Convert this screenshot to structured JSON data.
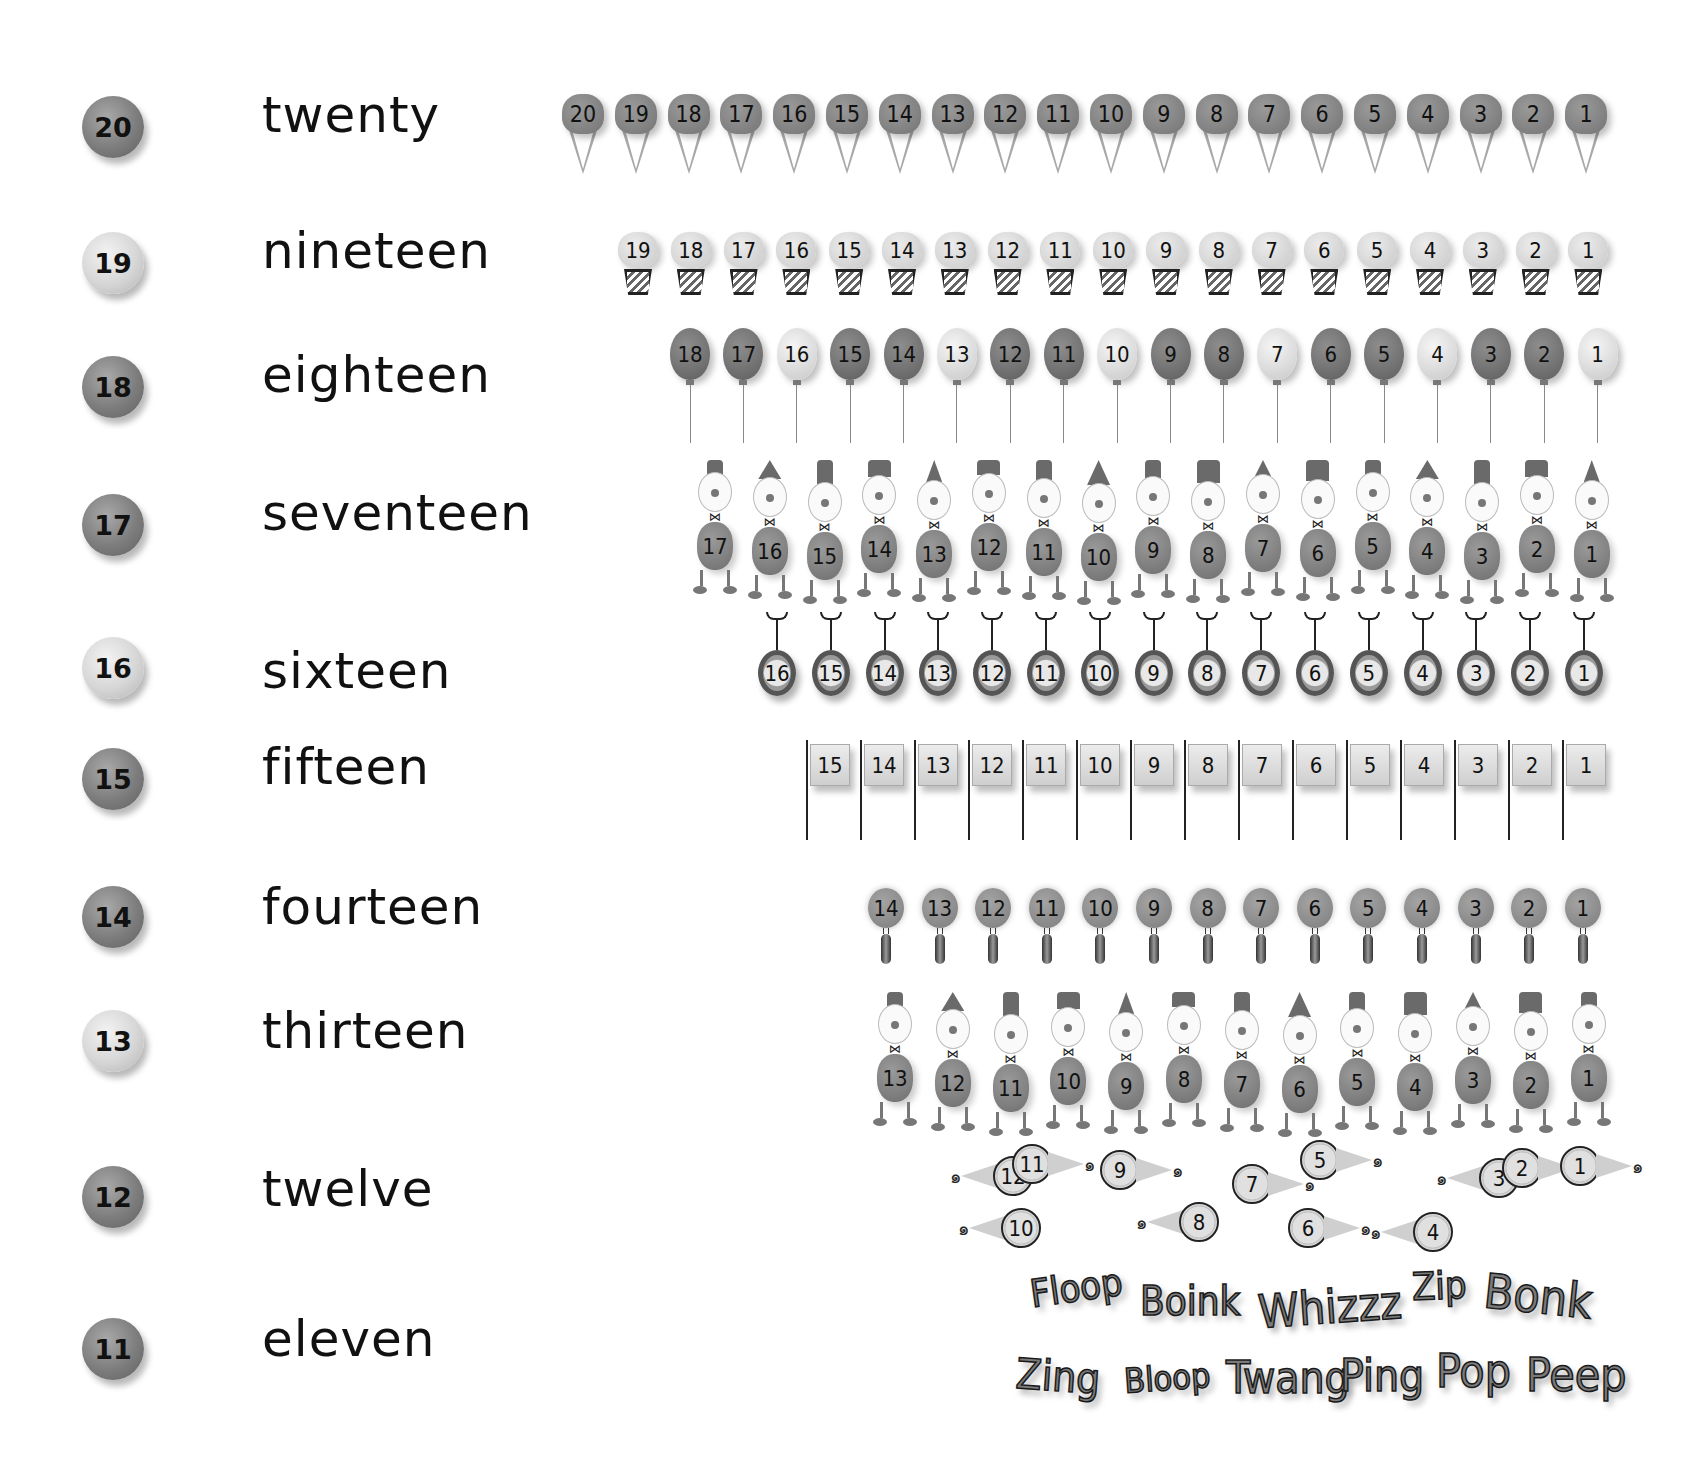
{
  "rows": [
    {
      "number": "20",
      "word": "twenty",
      "ball_tone": "dark",
      "item_type": "ice-cream-cone",
      "count": 20,
      "labels": [
        "20",
        "19",
        "18",
        "17",
        "16",
        "15",
        "14",
        "13",
        "12",
        "11",
        "10",
        "9",
        "8",
        "7",
        "6",
        "5",
        "4",
        "3",
        "2",
        "1"
      ]
    },
    {
      "number": "19",
      "word": "nineteen",
      "ball_tone": "light",
      "item_type": "flower-pot",
      "count": 19,
      "labels": [
        "19",
        "18",
        "17",
        "16",
        "15",
        "14",
        "13",
        "12",
        "11",
        "10",
        "9",
        "8",
        "7",
        "6",
        "5",
        "4",
        "3",
        "2",
        "1"
      ]
    },
    {
      "number": "18",
      "word": "eighteen",
      "ball_tone": "dark",
      "item_type": "balloon",
      "count": 18,
      "labels": [
        "18",
        "17",
        "16",
        "15",
        "14",
        "13",
        "12",
        "11",
        "10",
        "9",
        "8",
        "7",
        "6",
        "5",
        "4",
        "3",
        "2",
        "1"
      ],
      "tones": [
        "dark",
        "dark",
        "light",
        "dark",
        "dark",
        "light",
        "dark",
        "dark",
        "light",
        "dark",
        "dark",
        "light",
        "dark",
        "dark",
        "light",
        "dark",
        "dark",
        "light"
      ]
    },
    {
      "number": "17",
      "word": "seventeen",
      "ball_tone": "dark",
      "item_type": "clown",
      "count": 17,
      "labels": [
        "17",
        "16",
        "15",
        "14",
        "13",
        "12",
        "11",
        "10",
        "9",
        "8",
        "7",
        "6",
        "5",
        "4",
        "3",
        "2",
        "1"
      ]
    },
    {
      "number": "16",
      "word": "sixteen",
      "ball_tone": "light",
      "item_type": "unicycle",
      "count": 16,
      "labels": [
        "16",
        "15",
        "14",
        "13",
        "12",
        "11",
        "10",
        "9",
        "8",
        "7",
        "6",
        "5",
        "4",
        "3",
        "2",
        "1"
      ]
    },
    {
      "number": "15",
      "word": "fifteen",
      "ball_tone": "dark",
      "item_type": "flag",
      "count": 15,
      "labels": [
        "15",
        "14",
        "13",
        "12",
        "11",
        "10",
        "9",
        "8",
        "7",
        "6",
        "5",
        "4",
        "3",
        "2",
        "1"
      ]
    },
    {
      "number": "14",
      "word": "fourteen",
      "ball_tone": "dark",
      "item_type": "lollipop",
      "count": 14,
      "labels": [
        "14",
        "13",
        "12",
        "11",
        "10",
        "9",
        "8",
        "7",
        "6",
        "5",
        "4",
        "3",
        "2",
        "1"
      ]
    },
    {
      "number": "13",
      "word": "thirteen",
      "ball_tone": "light",
      "item_type": "clown",
      "count": 13,
      "labels": [
        "13",
        "12",
        "11",
        "10",
        "9",
        "8",
        "7",
        "6",
        "5",
        "4",
        "3",
        "2",
        "1"
      ]
    },
    {
      "number": "12",
      "word": "twelve",
      "ball_tone": "dark",
      "item_type": "party-horn",
      "count": 12,
      "labels": [
        "12",
        "11",
        "10",
        "9",
        "8",
        "7",
        "6",
        "5",
        "4",
        "3",
        "2",
        "1"
      ]
    },
    {
      "number": "11",
      "word": "eleven",
      "ball_tone": "dark",
      "item_type": "sound-word",
      "count": 11,
      "labels": [
        "Floop",
        "Boink",
        "Whizzz",
        "Zip",
        "Bonk",
        "Zing",
        "Bloop",
        "Twang",
        "Ping",
        "Pop",
        "Peep"
      ]
    }
  ],
  "colors": {
    "background": "#ffffff",
    "ink": "#111111",
    "dark_gray": "#7d7d7d",
    "light_gray": "#d6d6d6"
  }
}
